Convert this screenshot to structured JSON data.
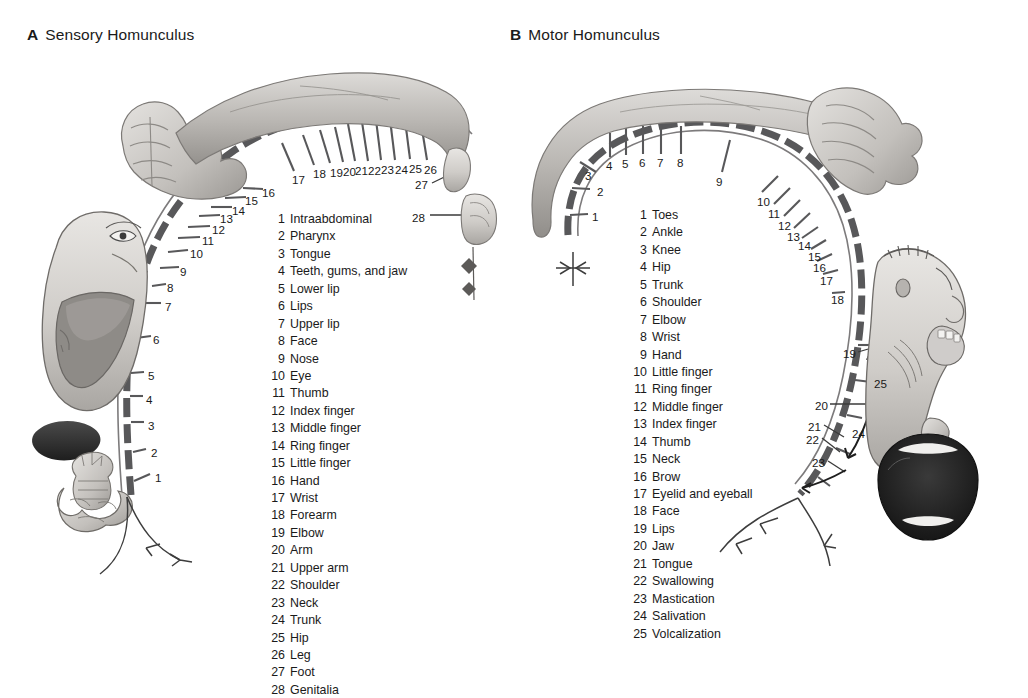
{
  "panels": {
    "sensory": {
      "tag": "A",
      "title": "Sensory Homunculus",
      "legend": [
        {
          "n": "1",
          "label": "Intraabdominal"
        },
        {
          "n": "2",
          "label": "Pharynx"
        },
        {
          "n": "3",
          "label": "Tongue"
        },
        {
          "n": "4",
          "label": "Teeth, gums, and jaw"
        },
        {
          "n": "5",
          "label": "Lower lip"
        },
        {
          "n": "6",
          "label": "Lips"
        },
        {
          "n": "7",
          "label": "Upper lip"
        },
        {
          "n": "8",
          "label": "Face"
        },
        {
          "n": "9",
          "label": "Nose"
        },
        {
          "n": "10",
          "label": "Eye"
        },
        {
          "n": "11",
          "label": "Thumb"
        },
        {
          "n": "12",
          "label": "Index finger"
        },
        {
          "n": "13",
          "label": "Middle finger"
        },
        {
          "n": "14",
          "label": "Ring finger"
        },
        {
          "n": "15",
          "label": "Little finger"
        },
        {
          "n": "16",
          "label": "Hand"
        },
        {
          "n": "17",
          "label": "Wrist"
        },
        {
          "n": "18",
          "label": "Forearm"
        },
        {
          "n": "19",
          "label": "Elbow"
        },
        {
          "n": "20",
          "label": "Arm"
        },
        {
          "n": "21",
          "label": "Upper arm"
        },
        {
          "n": "22",
          "label": "Shoulder"
        },
        {
          "n": "23",
          "label": "Neck"
        },
        {
          "n": "24",
          "label": "Trunk"
        },
        {
          "n": "25",
          "label": "Hip"
        },
        {
          "n": "26",
          "label": "Leg"
        },
        {
          "n": "27",
          "label": "Foot"
        },
        {
          "n": "28",
          "label": "Genitalia"
        }
      ],
      "tick_labels": [
        {
          "n": "1",
          "x": 155,
          "y": 472
        },
        {
          "n": "2",
          "x": 151,
          "y": 447
        },
        {
          "n": "3",
          "x": 148,
          "y": 420
        },
        {
          "n": "4",
          "x": 146,
          "y": 394
        },
        {
          "n": "5",
          "x": 148,
          "y": 370
        },
        {
          "n": "6",
          "x": 153,
          "y": 334
        },
        {
          "n": "7",
          "x": 165,
          "y": 301
        },
        {
          "n": "8",
          "x": 167,
          "y": 282
        },
        {
          "n": "9",
          "x": 180,
          "y": 266
        },
        {
          "n": "10",
          "x": 190,
          "y": 248
        },
        {
          "n": "11",
          "x": 202,
          "y": 235
        },
        {
          "n": "12",
          "x": 212,
          "y": 224
        },
        {
          "n": "13",
          "x": 220,
          "y": 213
        },
        {
          "n": "14",
          "x": 232,
          "y": 205
        },
        {
          "n": "15",
          "x": 245,
          "y": 195
        },
        {
          "n": "16",
          "x": 262,
          "y": 187
        },
        {
          "n": "17",
          "x": 292,
          "y": 174
        },
        {
          "n": "18",
          "x": 313,
          "y": 168
        },
        {
          "n": "19",
          "x": 330,
          "y": 167
        },
        {
          "n": "20",
          "x": 343,
          "y": 166
        },
        {
          "n": "21",
          "x": 355,
          "y": 165
        },
        {
          "n": "22",
          "x": 368,
          "y": 165
        },
        {
          "n": "23",
          "x": 381,
          "y": 164
        },
        {
          "n": "24",
          "x": 395,
          "y": 164
        },
        {
          "n": "25",
          "x": 409,
          "y": 163
        },
        {
          "n": "26",
          "x": 424,
          "y": 164
        },
        {
          "n": "27",
          "x": 415,
          "y": 179
        },
        {
          "n": "28",
          "x": 412,
          "y": 212
        }
      ]
    },
    "motor": {
      "tag": "B",
      "title": "Motor Homunculus",
      "legend": [
        {
          "n": "1",
          "label": "Toes"
        },
        {
          "n": "2",
          "label": "Ankle"
        },
        {
          "n": "3",
          "label": "Knee"
        },
        {
          "n": "4",
          "label": "Hip"
        },
        {
          "n": "5",
          "label": "Trunk"
        },
        {
          "n": "6",
          "label": "Shoulder"
        },
        {
          "n": "7",
          "label": "Elbow"
        },
        {
          "n": "8",
          "label": "Wrist"
        },
        {
          "n": "9",
          "label": "Hand"
        },
        {
          "n": "10",
          "label": "Little finger"
        },
        {
          "n": "11",
          "label": "Ring finger"
        },
        {
          "n": "12",
          "label": "Middle finger"
        },
        {
          "n": "13",
          "label": "Index finger"
        },
        {
          "n": "14",
          "label": "Thumb"
        },
        {
          "n": "15",
          "label": "Neck"
        },
        {
          "n": "16",
          "label": "Brow"
        },
        {
          "n": "17",
          "label": "Eyelid and eyeball"
        },
        {
          "n": "18",
          "label": "Face"
        },
        {
          "n": "19",
          "label": "Lips"
        },
        {
          "n": "20",
          "label": "Jaw"
        },
        {
          "n": "21",
          "label": "Tongue"
        },
        {
          "n": "22",
          "label": "Swallowing"
        },
        {
          "n": "23",
          "label": "Mastication"
        },
        {
          "n": "24",
          "label": "Salivation"
        },
        {
          "n": "25",
          "label": "Volcalization"
        }
      ],
      "tick_labels": [
        {
          "n": "1",
          "x": 592,
          "y": 211
        },
        {
          "n": "2",
          "x": 597,
          "y": 186
        },
        {
          "n": "3",
          "x": 585,
          "y": 170
        },
        {
          "n": "4",
          "x": 606,
          "y": 160
        },
        {
          "n": "5",
          "x": 622,
          "y": 158
        },
        {
          "n": "6",
          "x": 639,
          "y": 157
        },
        {
          "n": "7",
          "x": 657,
          "y": 157
        },
        {
          "n": "8",
          "x": 677,
          "y": 157
        },
        {
          "n": "9",
          "x": 716,
          "y": 176
        },
        {
          "n": "10",
          "x": 757,
          "y": 196
        },
        {
          "n": "11",
          "x": 768,
          "y": 208
        },
        {
          "n": "12",
          "x": 778,
          "y": 220
        },
        {
          "n": "13",
          "x": 787,
          "y": 231
        },
        {
          "n": "14",
          "x": 798,
          "y": 240
        },
        {
          "n": "15",
          "x": 808,
          "y": 251
        },
        {
          "n": "16",
          "x": 813,
          "y": 262
        },
        {
          "n": "17",
          "x": 820,
          "y": 275
        },
        {
          "n": "18",
          "x": 831,
          "y": 294
        },
        {
          "n": "19",
          "x": 843,
          "y": 348
        },
        {
          "n": "20",
          "x": 815,
          "y": 400
        },
        {
          "n": "21",
          "x": 808,
          "y": 421
        },
        {
          "n": "22",
          "x": 806,
          "y": 434
        },
        {
          "n": "23",
          "x": 812,
          "y": 457
        },
        {
          "n": "24",
          "x": 852,
          "y": 428
        },
        {
          "n": "25",
          "x": 874,
          "y": 378
        }
      ]
    }
  },
  "colors": {
    "ink": "#1a1a1a",
    "arc": "#58585a",
    "tick": "#6b6b6d",
    "tissue_light": "#d8d6d3",
    "tissue_mid": "#b3b0ac",
    "tissue_dark": "#8a8784",
    "mouth_dark": "#2b2b2b",
    "background": "#ffffff"
  }
}
